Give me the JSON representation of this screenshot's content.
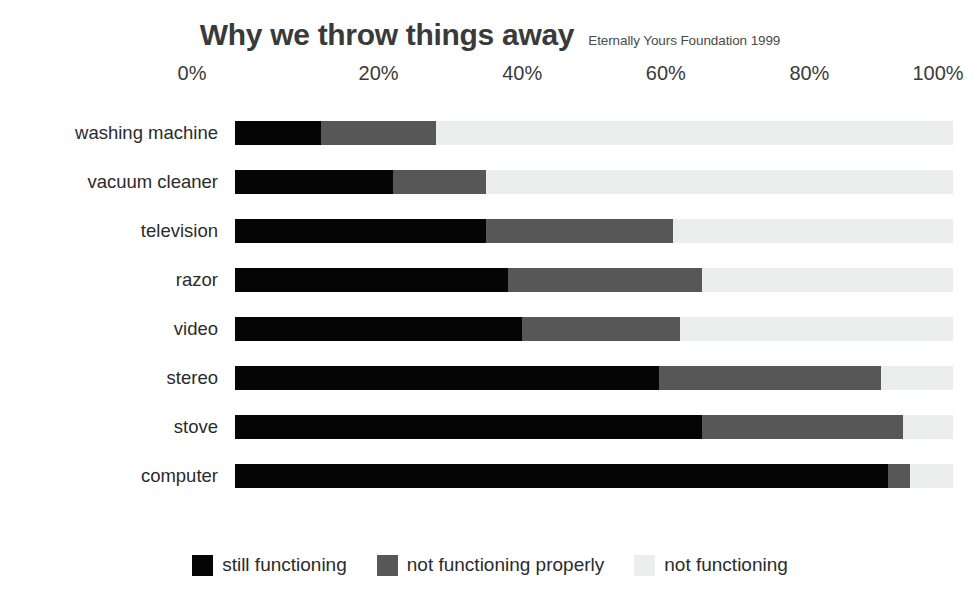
{
  "header": {
    "title": "Why we throw things away",
    "subtitle": "Eternally Yours Foundation 1999"
  },
  "chart_data": {
    "type": "bar",
    "orientation": "horizontal",
    "stacked": true,
    "normalized_percent": true,
    "title": "Why we throw things away",
    "subtitle": "Eternally Yours Foundation 1999",
    "xlabel": "",
    "ylabel": "",
    "xlim": [
      0,
      100
    ],
    "xticks": [
      0,
      20,
      40,
      60,
      80,
      100
    ],
    "xtick_labels": [
      "0%",
      "20%",
      "40%",
      "60%",
      "80%",
      "100%"
    ],
    "grid": false,
    "legend_position": "bottom",
    "categories": [
      "washing machine",
      "vacuum cleaner",
      "television",
      "razor",
      "video",
      "stereo",
      "stove",
      "computer"
    ],
    "series": [
      {
        "name": "still functioning",
        "color": "#050505",
        "values": [
          12,
          22,
          35,
          38,
          40,
          59,
          65,
          91
        ]
      },
      {
        "name": "not functioning properly",
        "color": "#575757",
        "values": [
          16,
          13,
          26,
          27,
          22,
          31,
          28,
          3
        ]
      },
      {
        "name": "not functioning",
        "color": "#eceded",
        "values": [
          72,
          65,
          39,
          35,
          38,
          10,
          7,
          6
        ]
      }
    ]
  },
  "legend": {
    "items": [
      {
        "label": "still functioning",
        "color": "#050505"
      },
      {
        "label": "not functioning properly",
        "color": "#575757"
      },
      {
        "label": "not functioning",
        "color": "#eceded"
      }
    ]
  }
}
